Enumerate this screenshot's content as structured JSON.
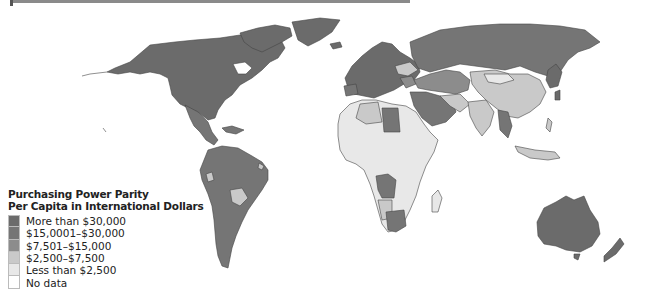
{
  "map": {
    "title_line1": "Purchasing Power Parity",
    "title_line2": "Per Capita in International Dollars",
    "legend": [
      {
        "label": "More than $30,000",
        "color": "#6b6b6b"
      },
      {
        "label": "$15,0001–$30,000",
        "color": "#757575"
      },
      {
        "label": "$7,501–$15,000",
        "color": "#8c8c8c"
      },
      {
        "label": "$2,500–$7,500",
        "color": "#c9c9c9"
      },
      {
        "label": "Less than $2,500",
        "color": "#e8e8e8"
      },
      {
        "label": "No data",
        "color": "#ffffff"
      }
    ]
  }
}
